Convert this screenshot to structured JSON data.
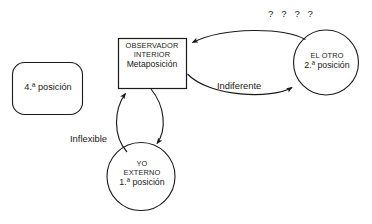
{
  "diagram": {
    "title_annotation": "? ? ? ?",
    "stroke_color": "#1a1a1a",
    "fill_color": "#ffffff",
    "text_color": "#1a1a1a",
    "background": "#ffffff",
    "nodes": {
      "observer_box": {
        "shape": "rectangle",
        "line_1": "OBSERVADOR",
        "line_2": "INTERIOR",
        "line_3": "Metaposición"
      },
      "other_circle": {
        "shape": "circle",
        "line_1": "EL OTRO",
        "line_2": "2.ª posición"
      },
      "self_circle": {
        "shape": "circle",
        "line_1": "YO",
        "line_2": "EXTERNO",
        "line_3": "1.ª posición"
      },
      "fourth_box": {
        "shape": "rounded-rectangle",
        "label": "4.ª posición"
      }
    },
    "edges": {
      "indiferente": {
        "label": "Indiferente",
        "from": "observer_box",
        "to": "other_circle"
      },
      "inflexible": {
        "label": "Inflexible",
        "from": "self_circle",
        "to": "observer_box"
      }
    }
  }
}
